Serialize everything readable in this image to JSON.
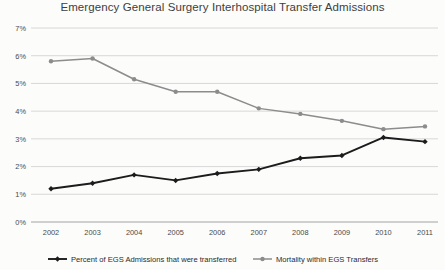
{
  "chart_data": {
    "type": "line",
    "title": "Emergency General Surgery Interhospital Transfer Admissions",
    "xlabel": "",
    "ylabel": "",
    "categories": [
      "2002",
      "2003",
      "2004",
      "2005",
      "2006",
      "2007",
      "2008",
      "2009",
      "2010",
      "2011"
    ],
    "ylim": [
      0,
      7
    ],
    "ytick_labels": [
      "0%",
      "1%",
      "2%",
      "3%",
      "4%",
      "5%",
      "6%",
      "7%"
    ],
    "ytick_values": [
      0,
      1,
      2,
      3,
      4,
      5,
      6,
      7
    ],
    "grid": true,
    "legend_position": "bottom",
    "series": [
      {
        "name": "Percent of EGS Admissions that were transferred",
        "color": "#1c1c1c",
        "marker": "diamond",
        "values": [
          1.2,
          1.4,
          1.7,
          1.5,
          1.75,
          1.9,
          2.3,
          2.4,
          3.05,
          2.9
        ]
      },
      {
        "name": "Mortality within EGS Transfers",
        "color": "#8c8c8c",
        "marker": "circle",
        "values": [
          5.8,
          5.9,
          5.15,
          4.7,
          4.7,
          4.1,
          3.9,
          3.65,
          3.35,
          3.45
        ]
      }
    ]
  },
  "colors": {
    "background": "#fcfcfb",
    "gridline": "#d4d4d4",
    "axis": "#9a9a9a",
    "title_text": "#3e3e3e",
    "tick_text": "#4a4a4a",
    "series_primary": "#1c1c1c",
    "series_secondary": "#8c8c8c"
  }
}
